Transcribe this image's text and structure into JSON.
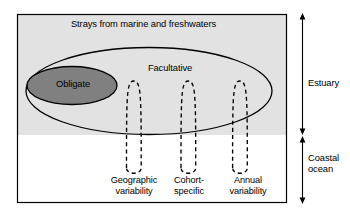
{
  "figure": {
    "type": "conceptual-diagram",
    "title_text": "Strays from marine and freshwaters",
    "regions": {
      "estuary_label": "Estuary",
      "coastal_ocean_label": "Coastal\nocean"
    },
    "groups": {
      "outer_ellipse_label": "Facultative",
      "inner_ellipse_label": "Obligate"
    },
    "variability_loops": [
      {
        "id": "geographic",
        "label": "Geographic\nvariability"
      },
      {
        "id": "cohort",
        "label": "Cohort-\nspecific"
      },
      {
        "id": "annual",
        "label": "Annual\nvariability"
      }
    ],
    "colors": {
      "panel_border": "#000000",
      "estuary_shading": "#e2e2e2",
      "coastal_background": "#ffffff",
      "obligate_fill": "#808080",
      "stroke": "#000000"
    }
  }
}
